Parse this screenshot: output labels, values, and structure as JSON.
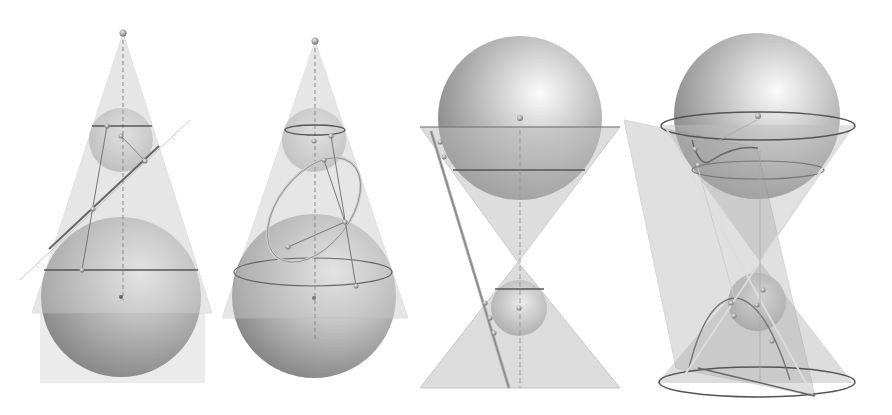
{
  "figure": {
    "background": "#ffffff",
    "colors": {
      "cone_fill": "#c8c8c8",
      "sphere_light": "#f4f4f4",
      "sphere_mid": "#b5b5b5",
      "sphere_dark": "#7a7a7a",
      "line": "#6a6a6a",
      "curve": "#9a9a9a",
      "point": "#8a8a8a"
    },
    "panels": [
      {
        "id": "panel-1",
        "label": "",
        "conic": "line-section"
      },
      {
        "id": "panel-2",
        "label": "",
        "conic": "ellipse"
      },
      {
        "id": "panel-3",
        "label": "",
        "conic": "double-cone-line"
      },
      {
        "id": "panel-4",
        "label": "",
        "conic": "hyperbola"
      }
    ]
  }
}
